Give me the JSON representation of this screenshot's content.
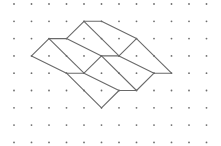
{
  "diagram": {
    "type": "dot-grid-figure",
    "grid": {
      "columns": 12,
      "rows": 9,
      "origin_x": 14,
      "origin_y": 4,
      "spacing_x": 17.5,
      "spacing_y": 17.3,
      "dot_color": "#6e6e6e",
      "dot_radius": 0.9
    },
    "line_color": "#6a6a6a",
    "segments": [
      [
        [
          4,
          1
        ],
        [
          5,
          1
        ]
      ],
      [
        [
          5,
          1
        ],
        [
          7,
          2
        ]
      ],
      [
        [
          4,
          1
        ],
        [
          3,
          2
        ]
      ],
      [
        [
          4,
          1
        ],
        [
          6,
          3
        ]
      ],
      [
        [
          2,
          2
        ],
        [
          3,
          2
        ]
      ],
      [
        [
          2,
          2
        ],
        [
          1,
          3
        ]
      ],
      [
        [
          2,
          2
        ],
        [
          4,
          4
        ]
      ],
      [
        [
          3,
          2
        ],
        [
          5,
          3
        ]
      ],
      [
        [
          1,
          3
        ],
        [
          3,
          4
        ]
      ],
      [
        [
          7,
          2
        ],
        [
          6,
          3
        ]
      ],
      [
        [
          7,
          2
        ],
        [
          9,
          4
        ]
      ],
      [
        [
          5,
          3
        ],
        [
          6,
          3
        ]
      ],
      [
        [
          5,
          3
        ],
        [
          4,
          4
        ]
      ],
      [
        [
          5,
          3
        ],
        [
          7,
          5
        ]
      ],
      [
        [
          6,
          3
        ],
        [
          8,
          4
        ]
      ],
      [
        [
          3,
          4
        ],
        [
          4,
          4
        ]
      ],
      [
        [
          4,
          4
        ],
        [
          6,
          5
        ]
      ],
      [
        [
          3,
          4
        ],
        [
          5,
          6
        ]
      ],
      [
        [
          8,
          4
        ],
        [
          9,
          4
        ]
      ],
      [
        [
          8,
          4
        ],
        [
          7,
          5
        ]
      ],
      [
        [
          6,
          5
        ],
        [
          7,
          5
        ]
      ],
      [
        [
          6,
          5
        ],
        [
          5,
          6
        ]
      ]
    ]
  }
}
